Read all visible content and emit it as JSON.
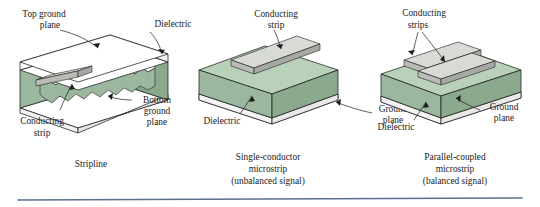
{
  "figure": {
    "type": "technical-illustration",
    "background_color": "#ffffff",
    "divider_color": "#5a7090"
  },
  "palette": {
    "dielectric_front": "#9bb79d",
    "dielectric_top": "#b9d0b9",
    "dielectric_side": "#8aa98d",
    "dielectric_dark": "#7d9c81",
    "conductor_top": "#d8dad5",
    "conductor_front": "#b9bcb6",
    "conductor_side": "#a7aaa4",
    "ground_plane": "#ffffff",
    "outline": "#1f1f1f",
    "text": "#1c1c1c"
  },
  "diagrams": [
    {
      "id": "stripline",
      "caption": "Stripline",
      "labels": [
        {
          "name": "top-ground-plane",
          "lines": [
            "Top ground",
            "plane"
          ]
        },
        {
          "name": "dielectric",
          "lines": [
            "Dielectric"
          ]
        },
        {
          "name": "bottom-ground-plane",
          "lines": [
            "Bottom",
            "ground",
            "plane"
          ]
        },
        {
          "name": "conducting-strip",
          "lines": [
            "Conducting",
            "strip"
          ]
        }
      ]
    },
    {
      "id": "single-conductor-microstrip",
      "caption_lines": [
        "Single-conductor",
        "microstrip",
        "(unbalanced signal)"
      ],
      "labels": [
        {
          "name": "conducting-strip",
          "lines": [
            "Conducting",
            "strip"
          ]
        },
        {
          "name": "dielectric",
          "lines": [
            "Dielectric"
          ]
        },
        {
          "name": "ground-plane",
          "lines": [
            "Ground",
            "plane"
          ]
        }
      ]
    },
    {
      "id": "parallel-coupled-microstrip",
      "caption_lines": [
        "Parallel-coupled",
        "microstrip",
        "(balanced signal)"
      ],
      "labels": [
        {
          "name": "conducting-strips",
          "lines": [
            "Conducting",
            "strips"
          ]
        },
        {
          "name": "dielectric",
          "lines": [
            "Dielectric"
          ]
        },
        {
          "name": "ground-plane",
          "lines": [
            "Ground",
            "plane"
          ]
        }
      ]
    }
  ],
  "text": {
    "stripline": {
      "top_ground_1": "Top ground",
      "top_ground_2": "plane",
      "dielectric": "Dielectric",
      "bottom_1": "Bottom",
      "bottom_2": "ground",
      "bottom_3": "plane",
      "cond_1": "Conducting",
      "cond_2": "strip",
      "caption": "Stripline"
    },
    "microstrip": {
      "cond_1": "Conducting",
      "cond_2": "strip",
      "dielectric": "Dielectric",
      "ground_1": "Ground",
      "ground_2": "plane",
      "cap_1": "Single-conductor",
      "cap_2": "microstrip",
      "cap_3": "(unbalanced signal)"
    },
    "coupled": {
      "cond_1": "Conducting",
      "cond_2": "strips",
      "dielectric": "Dielectric",
      "ground_1": "Ground",
      "ground_2": "plane",
      "cap_1": "Parallel-coupled",
      "cap_2": "microstrip",
      "cap_3": "(balanced signal)"
    }
  }
}
